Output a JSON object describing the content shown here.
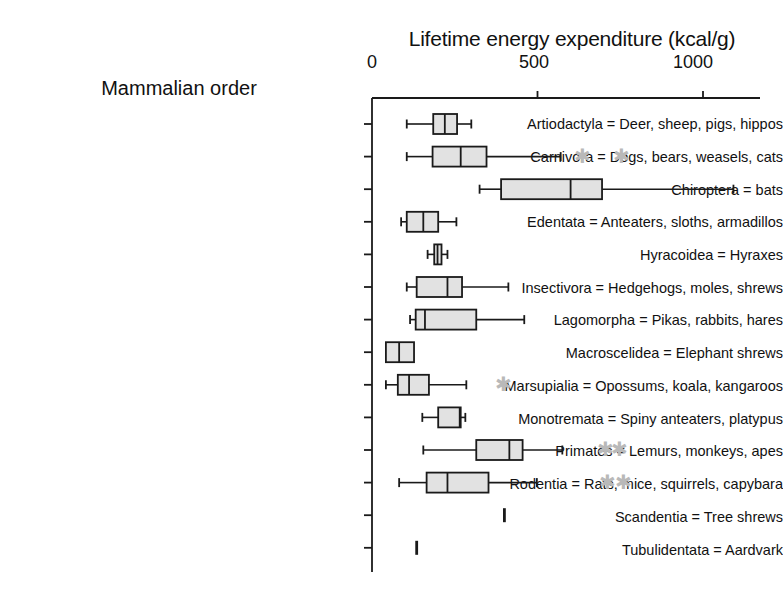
{
  "chart_data": {
    "type": "box",
    "title": "Lifetime energy expenditure (kcal/g)",
    "xlabel": "Lifetime energy expenditure (kcal/g)",
    "ylabel": "Mammalian order",
    "xlim": [
      0,
      1100
    ],
    "xticks": [
      0,
      500,
      1000
    ],
    "xtick_labels": [
      "0",
      "500",
      "1000"
    ],
    "grid": false,
    "legend": null,
    "categories": [
      "Artiodactyla = Deer, sheep, pigs, hippos",
      "Carnivora = Dogs, bears, weasels, cats",
      "Chiroptera = bats",
      "Edentata = Anteaters, sloths, armadillos",
      "Hyracoidea = Hyraxes",
      "Insectivora = Hedgehogs, moles, shrews",
      "Lagomorpha = Pikas, rabbits, hares",
      "Macroscelidea = Elephant shrews",
      "Marsupialia = Opossums, koala, kangaroos",
      "Monotremata = Spiny anteaters, platypus",
      "Primates = Lemurs, monkeys, apes",
      "Rodentia = Rats, mice, squirrels, capybara",
      "Scandentia = Tree shrews",
      "Tubulidentata = Aardvark"
    ],
    "boxes": [
      {
        "category": "Artiodactyla = Deer, sheep, pigs, hippos",
        "whisker_low": 105,
        "q1": 185,
        "median": 220,
        "q3": 257,
        "whisker_high": 300,
        "outliers": []
      },
      {
        "category": "Carnivora = Dogs, bears, weasels, cats",
        "whisker_low": 105,
        "q1": 183,
        "median": 268,
        "q3": 346,
        "whisker_high": 570,
        "outliers": [
          635,
          755
        ]
      },
      {
        "category": "Chiroptera = bats",
        "whisker_low": 325,
        "q1": 390,
        "median": 600,
        "q3": 695,
        "whisker_high": 1092,
        "outliers": []
      },
      {
        "category": "Edentata = Anteaters, sloths, armadillos",
        "whisker_low": 88,
        "q1": 105,
        "median": 155,
        "q3": 200,
        "whisker_high": 255,
        "outliers": []
      },
      {
        "category": "Hyracoidea = Hyraxes",
        "whisker_low": 168,
        "q1": 188,
        "median": 198,
        "q3": 210,
        "whisker_high": 228,
        "outliers": []
      },
      {
        "category": "Insectivora = Hedgehogs, moles, shrews",
        "whisker_low": 105,
        "q1": 135,
        "median": 228,
        "q3": 272,
        "whisker_high": 412,
        "outliers": []
      },
      {
        "category": "Lagomorpha = Pikas, rabbits, hares",
        "whisker_low": 115,
        "q1": 132,
        "median": 160,
        "q3": 315,
        "whisker_high": 460,
        "outliers": []
      },
      {
        "category": "Macroscelidea = Elephant shrews",
        "whisker_low": 42,
        "q1": 42,
        "median": 82,
        "q3": 127,
        "whisker_high": 127,
        "outliers": []
      },
      {
        "category": "Marsupialia = Opossums, koala, kangaroos",
        "whisker_low": 42,
        "q1": 78,
        "median": 112,
        "q3": 172,
        "whisker_high": 285,
        "outliers": [
          398
        ]
      },
      {
        "category": "Monotremata = Spiny anteaters, platypus",
        "whisker_low": 152,
        "q1": 200,
        "median": 265,
        "q3": 268,
        "whisker_high": 282,
        "outliers": []
      },
      {
        "category": "Primates = Lemurs, monkeys, apes",
        "whisker_low": 155,
        "q1": 315,
        "median": 415,
        "q3": 455,
        "whisker_high": 575,
        "outliers": [
          705,
          748
        ]
      },
      {
        "category": "Rodentia = Rats, mice, squirrels, capybara",
        "whisker_low": 82,
        "q1": 165,
        "median": 228,
        "q3": 352,
        "whisker_high": 498,
        "outliers": [
          712,
          760
        ]
      },
      {
        "category": "Scandentia = Tree shrews",
        "whisker_low": 400,
        "q1": 400,
        "median": 400,
        "q3": 400,
        "whisker_high": 400,
        "outliers": []
      },
      {
        "category": "Tubulidentata = Aardvark",
        "whisker_low": 135,
        "q1": 135,
        "median": 135,
        "q3": 135,
        "whisker_high": 135,
        "outliers": []
      }
    ]
  },
  "colors": {
    "box_fill": "#e2e2e2",
    "box_stroke": "#1a1a1a",
    "axis": "#1a1a1a",
    "outlier": "#b9b9b9",
    "text": "#111111"
  },
  "axis": {
    "x_title": "Lifetime energy expenditure (kcal/g)",
    "y_title": "Mammalian order",
    "tick_0": "0",
    "tick_500": "500",
    "tick_1000": "1000"
  }
}
